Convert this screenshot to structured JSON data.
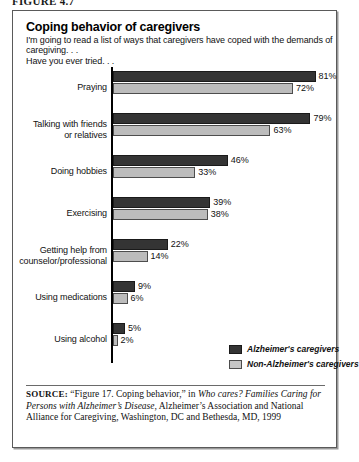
{
  "figure": {
    "caption": "FIGURE 4.7"
  },
  "header": {
    "title": "Coping behavior of caregivers",
    "intro_line_1": "I'm going to read a list of ways that caregivers have coped with the demands of",
    "intro_line_2": "caregiving. . .",
    "intro_line_3": "Have you ever tried. . ."
  },
  "legend": {
    "series_a_label": "Alzheimer's caregivers",
    "series_b_label": "Non-Alzheimer's caregivers",
    "series_a_color": "#343434",
    "series_b_color": "#c6c6c6"
  },
  "source": {
    "label": "SOURCE:",
    "text_1": " “Figure 17. Coping behavior,” in ",
    "italic_1": "Who cares? Families Caring for Persons with Alzheimer’s Disease",
    "text_2": ", Alzheimer’s Association and National Alliance for Caregiving, Washington, DC and Bethesda, MD, 1999"
  },
  "chart_data": {
    "type": "bar",
    "orientation": "horizontal",
    "title": "Coping behavior of caregivers",
    "subtitle": "I'm going to read a list of ways that caregivers have coped with the demands of caregiving. . . Have you ever tried. . .",
    "xlabel": "",
    "ylabel": "",
    "xlim": [
      0,
      81
    ],
    "grid": false,
    "legend_position": "bottom-right",
    "value_suffix": "%",
    "categories": [
      "Praying",
      "Talking with friends or relatives",
      "Doing hobbies",
      "Exercising",
      "Getting help from counselor/professional",
      "Using medications",
      "Using alcohol"
    ],
    "category_lines": [
      [
        "Praying"
      ],
      [
        "Talking with friends",
        "or relatives"
      ],
      [
        "Doing hobbies"
      ],
      [
        "Exercising"
      ],
      [
        "Getting help from",
        "counselor/professional"
      ],
      [
        "Using medications"
      ],
      [
        "Using alcohol"
      ]
    ],
    "series": [
      {
        "name": "Alzheimer's caregivers",
        "color": "#343434",
        "values": [
          81,
          79,
          46,
          39,
          22,
          9,
          5
        ],
        "labels": [
          "81%",
          "79%",
          "46%",
          "39%",
          "22%",
          "9%",
          "5%"
        ]
      },
      {
        "name": "Non-Alzheimer's caregivers",
        "color": "#c6c6c6",
        "values": [
          72,
          63,
          33,
          38,
          14,
          6,
          2
        ],
        "labels": [
          "72%",
          "63%",
          "33%",
          "38%",
          "14%",
          "6%",
          "2%"
        ]
      }
    ]
  }
}
